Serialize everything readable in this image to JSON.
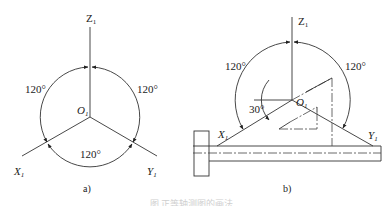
{
  "figure": {
    "panel_a": {
      "caption": "a)",
      "axes": {
        "z": {
          "letter": "Z",
          "sub": "1"
        },
        "x": {
          "letter": "X",
          "sub": "1"
        },
        "y": {
          "letter": "Y",
          "sub": "1"
        }
      },
      "origin": {
        "letter": "O",
        "sub": "1"
      },
      "angles": {
        "left": "120°",
        "right": "120°",
        "bottom": "120°"
      }
    },
    "panel_b": {
      "caption": "b)",
      "axes": {
        "z": {
          "letter": "Z",
          "sub": "1"
        },
        "x": {
          "letter": "X",
          "sub": "1"
        },
        "y": {
          "letter": "Y",
          "sub": "1"
        }
      },
      "origin": {
        "letter": "O",
        "sub": "1"
      },
      "angles": {
        "left": "120°",
        "right": "120°",
        "tilt": "30°"
      }
    },
    "bottom_caption": "图 正等轴测图的画法"
  }
}
